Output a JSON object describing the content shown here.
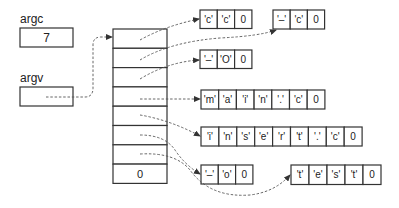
{
  "variables": {
    "argc": {
      "label": "argc",
      "value": "7"
    },
    "argv": {
      "label": "argv",
      "value": ""
    }
  },
  "pointer_array": {
    "cells": [
      "",
      "",
      "",
      "",
      "",
      "",
      "",
      "0"
    ]
  },
  "strings": [
    {
      "id": "s0",
      "cells": [
        "'c'",
        "'c'",
        "0"
      ]
    },
    {
      "id": "s1",
      "cells": [
        "'–'",
        "'c'",
        "0"
      ]
    },
    {
      "id": "s2",
      "cells": [
        "'–'",
        "'O'",
        "0"
      ]
    },
    {
      "id": "s3",
      "cells": [
        "'m'",
        "'a'",
        "'i'",
        "'n'",
        "'.'",
        "'c'",
        "0"
      ]
    },
    {
      "id": "s4",
      "cells": [
        "'i'",
        "'n'",
        "'s'",
        "'e'",
        "'r'",
        "'t'",
        "'.'",
        "'c'",
        "0"
      ]
    },
    {
      "id": "s5",
      "cells": [
        "'–'",
        "'o'",
        "0"
      ]
    },
    {
      "id": "s6",
      "cells": [
        "'t'",
        "'e'",
        "'s'",
        "'t'",
        "0"
      ]
    }
  ],
  "colors": {
    "stroke": "#333333",
    "pointer": "#555555",
    "background": "#ffffff"
  }
}
